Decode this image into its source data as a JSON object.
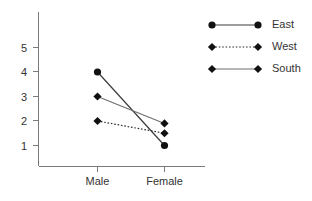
{
  "chart_data": {
    "type": "line",
    "title": "",
    "xlabel": "",
    "ylabel": "",
    "categories": [
      "Male",
      "Female"
    ],
    "x": [
      0,
      1
    ],
    "ylim": [
      0,
      5.8
    ],
    "xlim": [
      -0.45,
      1.65
    ],
    "yticks": [
      1,
      2,
      3,
      4,
      5
    ],
    "ytick_labels": [
      "1",
      "2",
      "3",
      "4",
      "5"
    ],
    "xtick_labels": [
      "Male",
      "Female"
    ],
    "grid": false,
    "legend_position": "top-right",
    "series": [
      {
        "name": "East",
        "values": [
          4.0,
          1.0
        ],
        "marker": "circle",
        "line_style": "solid",
        "color": "#3b3b3b",
        "marker_color": "#111111"
      },
      {
        "name": "West",
        "values": [
          2.0,
          1.5
        ],
        "marker": "diamond",
        "line_style": "dotted",
        "color": "#2e2e2e",
        "marker_color": "#111111"
      },
      {
        "name": "South",
        "values": [
          3.0,
          1.9
        ],
        "marker": "diamond",
        "line_style": "solid",
        "color": "#6f6f6f",
        "marker_color": "#111111"
      }
    ]
  },
  "legend": {
    "entries": [
      {
        "label": "East"
      },
      {
        "label": "West"
      },
      {
        "label": "South"
      }
    ]
  },
  "axis": {
    "y_labels": [
      "5",
      "4",
      "3",
      "2",
      "1"
    ],
    "x_labels": [
      "Male",
      "Female"
    ]
  }
}
